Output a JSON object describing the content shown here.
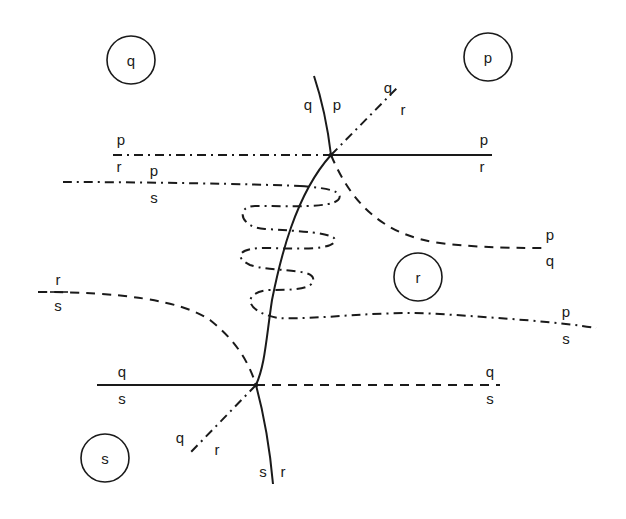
{
  "diagram": {
    "type": "phase-diagram-schematic",
    "phase_regions": [
      {
        "id": "q",
        "label": "q"
      },
      {
        "id": "p",
        "label": "p"
      },
      {
        "id": "r",
        "label": "r"
      },
      {
        "id": "s",
        "label": "s"
      }
    ],
    "upper_triple_point": {
      "labels": {
        "curve_left": "q",
        "curve_right": "p",
        "diag_top": "q",
        "diag_bottom": "r",
        "right_num": "p",
        "right_den": "r",
        "left_num": "p",
        "left_den": "r"
      }
    },
    "lower_triple_point": {
      "labels": {
        "left_num": "q",
        "left_den": "s",
        "right_num": "q",
        "right_den": "s",
        "diag_top": "q",
        "diag_bottom": "r",
        "curve_left": "s",
        "curve_right": "r"
      }
    },
    "boundary_labels": {
      "ps_upper_num": "p",
      "ps_upper_den": "s",
      "pq_num": "p",
      "pq_den": "q",
      "rs_num": "r",
      "rs_den": "s",
      "ps_lower_num": "p",
      "ps_lower_den": "s"
    },
    "line_styles": {
      "solid": "stable boundary",
      "dashed": "metastable extension",
      "dash-dot": "metastable extension"
    },
    "stroke_color": "#1a1a1a",
    "background_color": "#ffffff"
  }
}
